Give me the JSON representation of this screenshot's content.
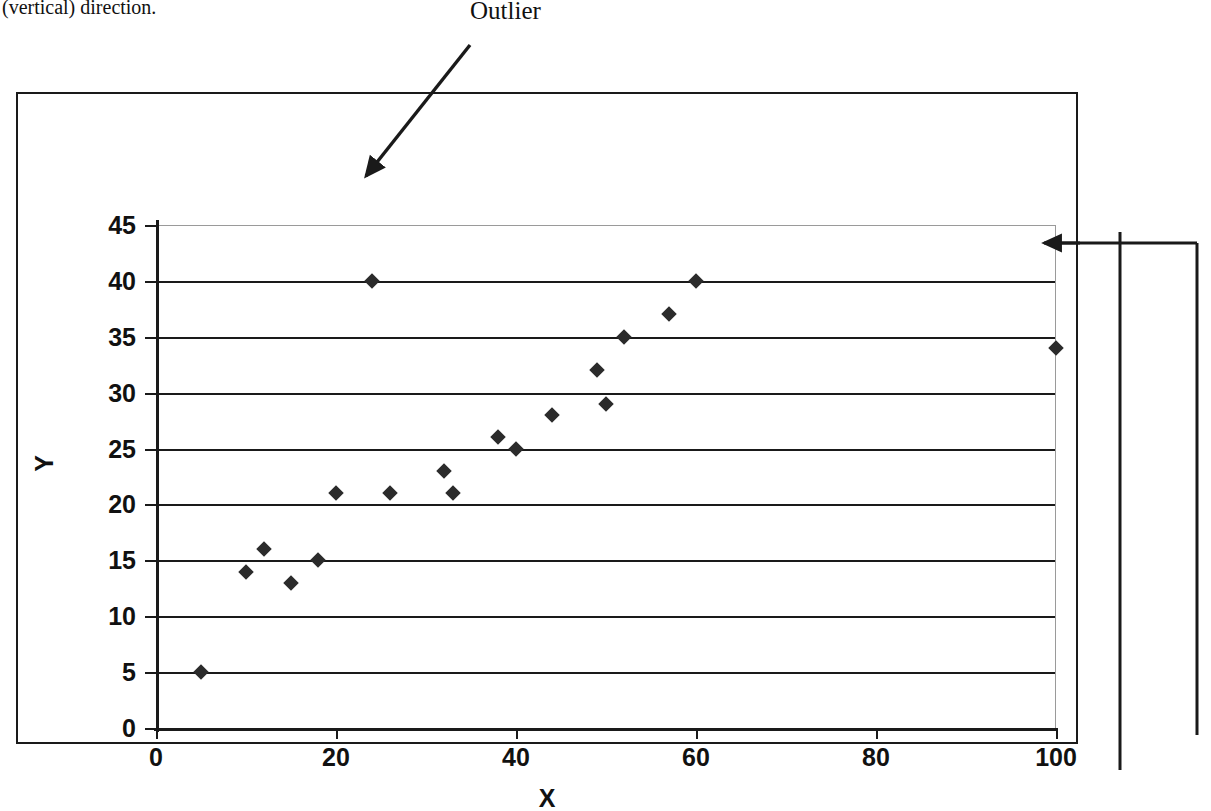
{
  "caption": {
    "top_text": "(vertical) direction."
  },
  "annotations": {
    "outlier_label": "Outlier"
  },
  "chart_data": {
    "type": "scatter",
    "title": "",
    "xlabel": "X",
    "ylabel": "Y",
    "xlim": [
      0,
      100
    ],
    "ylim": [
      0,
      45
    ],
    "xticks": [
      0,
      20,
      40,
      60,
      80,
      100
    ],
    "yticks": [
      0,
      5,
      10,
      15,
      20,
      25,
      30,
      35,
      40,
      45
    ],
    "grid": "horizontal",
    "legend": "none",
    "marker": "diamond",
    "marker_color": "#2b2b2b",
    "points": [
      {
        "x": 5,
        "y": 5
      },
      {
        "x": 10,
        "y": 14
      },
      {
        "x": 12,
        "y": 16
      },
      {
        "x": 15,
        "y": 13
      },
      {
        "x": 18,
        "y": 15
      },
      {
        "x": 20,
        "y": 21
      },
      {
        "x": 24,
        "y": 40
      },
      {
        "x": 26,
        "y": 21
      },
      {
        "x": 32,
        "y": 23
      },
      {
        "x": 33,
        "y": 21
      },
      {
        "x": 38,
        "y": 26
      },
      {
        "x": 40,
        "y": 25
      },
      {
        "x": 44,
        "y": 28
      },
      {
        "x": 49,
        "y": 32
      },
      {
        "x": 50,
        "y": 29
      },
      {
        "x": 52,
        "y": 35
      },
      {
        "x": 57,
        "y": 37
      },
      {
        "x": 60,
        "y": 40
      },
      {
        "x": 100,
        "y": 34
      }
    ],
    "annotated_points": [
      {
        "label": "Outlier",
        "x": 24,
        "y": 40
      },
      {
        "label": "",
        "x": 100,
        "y": 34
      }
    ]
  }
}
